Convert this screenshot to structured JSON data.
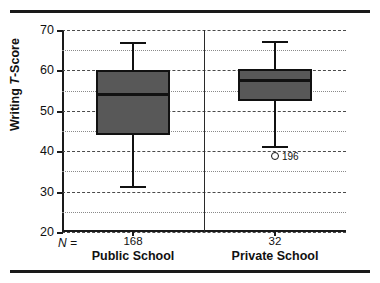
{
  "chart_data": {
    "type": "box",
    "title": "",
    "xlabel": "",
    "ylabel": "Writing T-Score",
    "ylabel_prefix": "Writing ",
    "ylabel_italic": "T",
    "ylabel_suffix": "-Score",
    "ylim": [
      20,
      70
    ],
    "ytick_labels": [
      "70",
      "60",
      "50",
      "40",
      "30",
      "20"
    ],
    "yticks": [
      70,
      60,
      50,
      40,
      30,
      20
    ],
    "minor_gridlines": [
      65,
      55,
      45,
      35,
      25
    ],
    "grid": true,
    "legend": "none",
    "n_prefix": "N =",
    "categories": [
      "Public School",
      "Private School"
    ],
    "series": [
      {
        "name": "Public School",
        "n": "168",
        "whisker_low": 31.3,
        "q1": 44.0,
        "median": 54.0,
        "q3": 60.0,
        "whisker_high": 67.0,
        "outliers": []
      },
      {
        "name": "Private School",
        "n": "32",
        "whisker_low": 41.2,
        "q1": 52.5,
        "median": 57.5,
        "q3": 60.3,
        "whisker_high": 67.3,
        "outliers": [
          {
            "value": 38.7,
            "label": "196"
          }
        ]
      }
    ],
    "colors": {
      "box_fill": "#585858",
      "box_edge": "#111111",
      "grid_major": "#4a4a4a",
      "grid_minor": "#8a8a8a",
      "axis": "#1a1a1a",
      "rule": "#1a1a1a"
    }
  }
}
